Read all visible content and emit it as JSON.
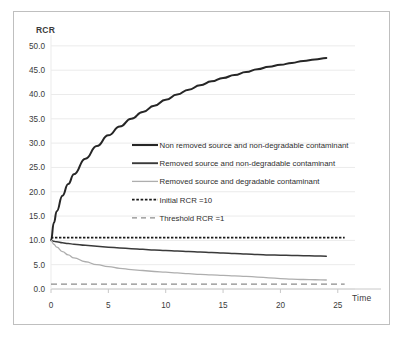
{
  "figure": {
    "name": "rcr-vs-time-chart"
  },
  "chart_data": {
    "type": "line",
    "title": "",
    "xlabel": "Time",
    "ylabel": "RCR",
    "xlim": [
      0,
      26.5
    ],
    "ylim": [
      0,
      51
    ],
    "grid": true,
    "legend_position": "center",
    "x_ticks": [
      "0",
      "5",
      "10",
      "15",
      "20",
      "25"
    ],
    "x_tick_values": [
      0,
      5,
      10,
      15,
      20,
      25
    ],
    "y_ticks": [
      "0.0",
      "5.0",
      "10.0",
      "15.0",
      "20.0",
      "25.0",
      "30.0",
      "35.0",
      "40.0",
      "45.0",
      "50.0"
    ],
    "y_tick_values": [
      0,
      5,
      10,
      15,
      20,
      25,
      30,
      35,
      40,
      45,
      50
    ],
    "series": [
      {
        "name": "Non removed source and non-degradable contaminant",
        "style": "solid",
        "color": "#262626",
        "width": 2.0,
        "x": [
          0,
          0.25,
          0.5,
          1,
          1.5,
          2,
          3,
          4,
          5,
          6,
          7,
          8,
          9,
          10,
          11,
          12,
          13,
          14,
          15,
          16,
          17,
          18,
          19,
          20,
          21,
          22,
          23,
          24
        ],
        "values": [
          10.0,
          13.6,
          16.0,
          19.2,
          21.6,
          23.6,
          26.8,
          29.4,
          31.6,
          33.4,
          35.0,
          36.4,
          37.7,
          38.9,
          40.0,
          41.0,
          41.9,
          42.7,
          43.4,
          44.0,
          44.6,
          45.2,
          45.7,
          46.1,
          46.5,
          46.9,
          47.2,
          47.5
        ]
      },
      {
        "name": "Removed source and non-degradable contaminant",
        "style": "solid",
        "color": "#3a3a3a",
        "width": 1.5,
        "x": [
          0,
          0.25,
          0.5,
          1,
          1.5,
          2,
          3,
          4,
          5,
          6,
          7,
          8,
          9,
          10,
          11,
          12,
          13,
          14,
          15,
          16,
          17,
          18,
          19,
          20,
          21,
          22,
          23,
          24
        ],
        "values": [
          10.0,
          9.8,
          9.7,
          9.5,
          9.35,
          9.2,
          9.0,
          8.8,
          8.6,
          8.45,
          8.3,
          8.15,
          8.0,
          7.9,
          7.8,
          7.7,
          7.6,
          7.5,
          7.4,
          7.3,
          7.2,
          7.1,
          7.0,
          6.95,
          6.9,
          6.85,
          6.8,
          6.75
        ]
      },
      {
        "name": "Removed source and degradable contaminant",
        "style": "solid",
        "color": "#aeaeae",
        "width": 1.3,
        "x": [
          0,
          0.25,
          0.5,
          1,
          1.5,
          2,
          3,
          4,
          5,
          6,
          7,
          8,
          9,
          10,
          11,
          12,
          13,
          14,
          15,
          16,
          17,
          18,
          19,
          20,
          21,
          22,
          23,
          24
        ],
        "values": [
          10.0,
          9.2,
          8.6,
          7.7,
          7.0,
          6.4,
          5.6,
          5.0,
          4.6,
          4.25,
          4.0,
          3.8,
          3.6,
          3.45,
          3.3,
          3.15,
          3.0,
          2.9,
          2.8,
          2.7,
          2.6,
          2.45,
          2.3,
          2.15,
          2.05,
          1.95,
          1.9,
          1.85
        ]
      }
    ],
    "reference_lines": [
      {
        "name": "Initial RCR =10",
        "style": "dotted",
        "color": "#1a1a1a",
        "width": 1.8,
        "y": 10.55,
        "x_start": 0,
        "x_end": 25.6
      },
      {
        "name": "Threshold RCR =1",
        "style": "dashed",
        "color": "#8c8c8c",
        "width": 1.4,
        "y": 1.0,
        "x_start": 0,
        "x_end": 25.6
      }
    ],
    "legend": [
      {
        "label": "Non removed source and non-degradable contaminant",
        "swatch": "solid-thick-dark"
      },
      {
        "label": "Removed source and non-degradable contaminant",
        "swatch": "solid-dark"
      },
      {
        "label": "Removed source and degradable contaminant",
        "swatch": "solid-gray"
      },
      {
        "label": "Initial RCR =10",
        "swatch": "dotted-black"
      },
      {
        "label": "Threshold RCR =1",
        "swatch": "dashed-gray"
      }
    ],
    "colors": {
      "grid": "#ebebeb",
      "axis": "#c8c8c8",
      "text": "#3b3b3b",
      "frame": "#bfbfbf"
    }
  }
}
